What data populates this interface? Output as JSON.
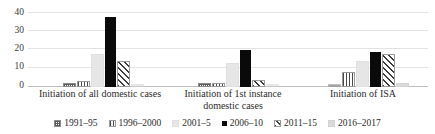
{
  "chart_data": {
    "type": "bar",
    "title": "",
    "xlabel": "",
    "ylabel": "",
    "ylim": [
      0,
      40
    ],
    "yticks": [
      0,
      10,
      20,
      30,
      40
    ],
    "grid": true,
    "legend_position": "bottom",
    "categories": [
      "Initiation of all domestic cases",
      "Initiation of 1st instance domestic cases",
      "Initiation of ISA"
    ],
    "series": [
      {
        "name": "1991–95",
        "values": [
          1,
          1,
          0
        ]
      },
      {
        "name": "1996–2000",
        "values": [
          2,
          1,
          7
        ]
      },
      {
        "name": "2001–5",
        "values": [
          17,
          12,
          13
        ]
      },
      {
        "name": "2006–10",
        "values": [
          38,
          20,
          19
        ]
      },
      {
        "name": "2011–15",
        "values": [
          13,
          3,
          17
        ]
      },
      {
        "name": "2016–2017",
        "values": [
          0,
          0,
          1
        ]
      }
    ]
  },
  "legend": {
    "items": [
      {
        "label": "1991–95",
        "pattern": "p-dot"
      },
      {
        "label": "1996–2000",
        "pattern": "p-vstripe"
      },
      {
        "label": "2001–5",
        "pattern": "p-lgray"
      },
      {
        "label": "2006–10",
        "pattern": "p-black"
      },
      {
        "label": "2011–15",
        "pattern": "p-hatch"
      },
      {
        "label": "2016–2017",
        "pattern": "p-lgray2"
      }
    ]
  },
  "axis": {
    "y_tick_labels": [
      "40",
      "30",
      "20",
      "10",
      "0"
    ]
  },
  "colors": {
    "grid": "#e2e2e2",
    "axis": "#bdbdbd",
    "text": "#2b2b2b",
    "bar_dark": "#0a0a0a",
    "bar_light": "#e6e6e6"
  }
}
